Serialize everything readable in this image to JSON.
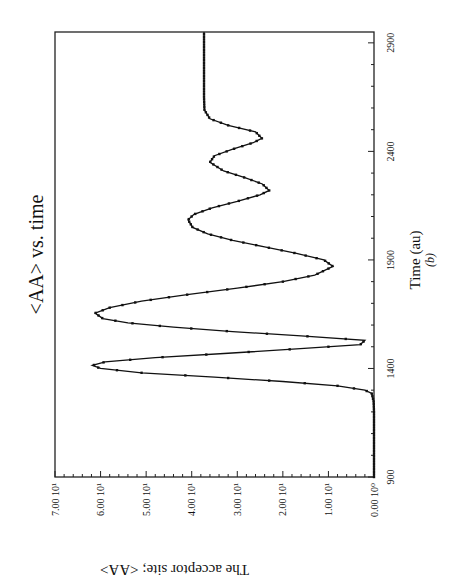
{
  "chart_data": {
    "type": "line",
    "title": "<AA> vs. time",
    "xlabel": "Time (au)",
    "xlabel_sub": "(b)",
    "ylabel": "The acceptor site; <AA>",
    "orientation_note": "figure printed rotated 90 degrees",
    "xlim": [
      900,
      2950
    ],
    "ylim": [
      0,
      7
    ],
    "x_ticks": [
      "900",
      "1400",
      "1900",
      "2400",
      "2900"
    ],
    "x_tick_values": [
      900,
      1400,
      1900,
      2400,
      2900
    ],
    "y_ticks": [
      "0.00 10⁰",
      "1.00 10¹",
      "2.00 10¹",
      "3.00 10¹",
      "4.00 10¹",
      "5.00 10¹",
      "6.00 10¹",
      "7.00 10¹"
    ],
    "y_tick_values": [
      0,
      1,
      2,
      3,
      4,
      5,
      6,
      7
    ],
    "grid": false,
    "legend": null,
    "series": [
      {
        "name": "<AA>",
        "marker": "small square",
        "color": "#111111",
        "x": [
          900,
          1000,
          1100,
          1200,
          1250,
          1285,
          1300,
          1320,
          1340,
          1360,
          1380,
          1400,
          1414,
          1430,
          1450,
          1470,
          1490,
          1510,
          1530,
          1550,
          1570,
          1590,
          1610,
          1630,
          1655,
          1680,
          1710,
          1740,
          1770,
          1800,
          1830,
          1870,
          1900,
          1930,
          1960,
          1990,
          2020,
          2050,
          2085,
          2110,
          2140,
          2170,
          2200,
          2220,
          2250,
          2280,
          2310,
          2350,
          2380,
          2410,
          2440,
          2460,
          2490,
          2520,
          2550,
          2590,
          2650,
          2750,
          2850,
          2950
        ],
        "y": [
          0.0,
          0.0,
          0.0,
          0.0,
          0.01,
          0.05,
          0.2,
          0.8,
          2.0,
          3.5,
          5.1,
          6.0,
          6.18,
          5.9,
          4.8,
          3.2,
          1.7,
          0.3,
          0.2,
          1.6,
          3.1,
          4.4,
          5.4,
          5.95,
          6.12,
          5.8,
          5.1,
          4.1,
          3.0,
          2.0,
          1.3,
          0.9,
          1.1,
          1.7,
          2.4,
          3.1,
          3.65,
          3.98,
          4.08,
          3.95,
          3.55,
          3.0,
          2.5,
          2.3,
          2.45,
          2.85,
          3.3,
          3.6,
          3.5,
          3.1,
          2.65,
          2.46,
          2.6,
          3.2,
          3.6,
          3.72,
          3.73,
          3.73,
          3.73,
          3.73
        ]
      }
    ]
  },
  "figure": {
    "title": "<AA> vs. time",
    "xlabel": "Time (au)",
    "xlabel_sub": "(b)",
    "ylabel": "The acceptor site; <AA>"
  }
}
